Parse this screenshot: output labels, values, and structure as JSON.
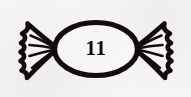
{
  "image": {
    "title": "Wrapped candy line drawing",
    "subject": "candy-sweet",
    "style": "hand-drawn black ink outline",
    "background_color": "#f7f6f4",
    "ink_color": "#100d0c",
    "fill_color": "#fbfaf9",
    "width": 191,
    "height": 97
  },
  "label": {
    "number": "11",
    "location": "center of candy body"
  },
  "parts": {
    "body_name": "candy-body-oval",
    "left_wrapper_name": "left-wrapper-twist",
    "right_wrapper_name": "right-wrapper-twist",
    "crease_count_left": 4,
    "crease_count_right": 4
  }
}
